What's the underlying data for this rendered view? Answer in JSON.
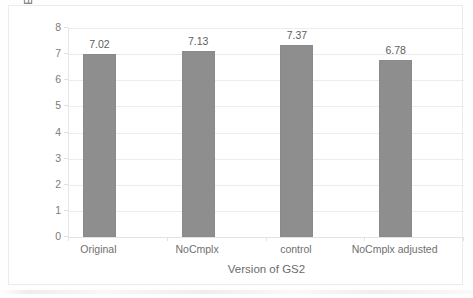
{
  "chart_data": {
    "type": "bar",
    "title": "",
    "subtitle": "",
    "categories": [
      "Original",
      "NoCmplx",
      "control",
      "NoCmplx adjusted"
    ],
    "values": [
      7.02,
      7.13,
      7.37,
      6.78
    ],
    "data_labels": [
      "7.02",
      "7.13",
      "7.37",
      "6.78"
    ],
    "xlabel": "Version of GS2",
    "ylabel": "Execution time (sec.)",
    "ylim": [
      0,
      8
    ],
    "ytick_interval": 1,
    "ytick_labels": [
      "8",
      "7",
      "6",
      "5",
      "4",
      "3",
      "2",
      "1",
      "0"
    ],
    "grid": true,
    "grid_axis": "y",
    "legend": false,
    "legend_position": "none",
    "series": [
      {
        "name": "Execution time",
        "values": [
          7.02,
          7.13,
          7.37,
          6.78
        ]
      }
    ]
  },
  "style": {
    "bar_color": "#8e8e8e",
    "bar_border_color": "#8a8a8a",
    "gridline_color": "#ececed",
    "axis_line_color": "#e6e6e7",
    "tick_label_color": "#7b7b7b",
    "axis_title_color": "#6b6b6b",
    "data_label_color": "#5e5e5e",
    "plot_background": "#ffffff",
    "frame_border_color": "#ebebeb"
  }
}
